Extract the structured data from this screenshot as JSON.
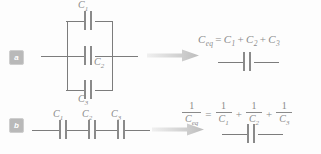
{
  "figure": {
    "background_color": "#fdfdfd",
    "line_color": "#7c7c7c",
    "plate_color": "#8a8a8a",
    "text_color": "#8a8a8a",
    "badge_color": "#b9b9b9",
    "arrow_color": "#cfcfcf"
  },
  "parts": {
    "a": {
      "badge": "a",
      "arrangement": "parallel",
      "capacitor_labels": {
        "top": "C",
        "top_sub": "1",
        "middle": "C",
        "middle_sub": "2",
        "bottom": "C",
        "bottom_sub": "3"
      },
      "equation": {
        "lhs": "C",
        "lhs_sub": "eq",
        "equals": "=",
        "term1": "C",
        "term1_sub": "1",
        "plus1": "+",
        "term2": "C",
        "term2_sub": "2",
        "plus2": "+",
        "term3": "C",
        "term3_sub": "3"
      },
      "result_symbol": "equivalent-capacitor"
    },
    "b": {
      "badge": "b",
      "arrangement": "series",
      "capacitor_labels": {
        "first": "C",
        "first_sub": "1",
        "second": "C",
        "second_sub": "2",
        "third": "C",
        "third_sub": "3"
      },
      "equation": {
        "lhs_num": "1",
        "lhs_den": "C",
        "lhs_den_sub": "eq",
        "equals": "=",
        "t1_num": "1",
        "t1_den": "C",
        "t1_den_sub": "1",
        "plus1": "+",
        "t2_num": "1",
        "t2_den": "C",
        "t2_den_sub": "2",
        "plus2": "+",
        "t3_num": "1",
        "t3_den": "C",
        "t3_den_sub": "3"
      },
      "result_symbol": "equivalent-capacitor"
    }
  }
}
